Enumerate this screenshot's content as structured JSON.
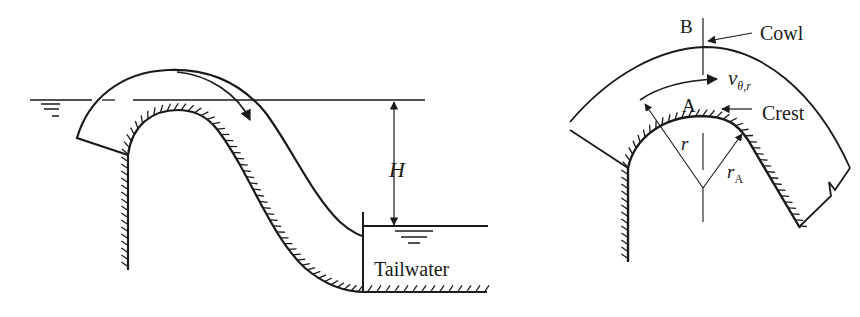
{
  "figure": {
    "left_panel": {
      "title": "Siphon spillway",
      "labels": {
        "head": "H",
        "tailwater": "Tailwater"
      },
      "symbols": {
        "upstream_water_surface": "water-surface-symbol",
        "tailwater_surface": "water-surface-symbol"
      }
    },
    "right_panel": {
      "title": "Crest detail",
      "labels": {
        "section_b": "B",
        "section_a": "A",
        "cowl": "Cowl",
        "crest": "Crest",
        "velocity_main": "v",
        "velocity_sub": "θ,r",
        "radius": "r",
        "radius_a_main": "r",
        "radius_a_sub": "A"
      }
    },
    "colors": {
      "stroke": "#1a1a1a",
      "background": "#ffffff"
    }
  }
}
